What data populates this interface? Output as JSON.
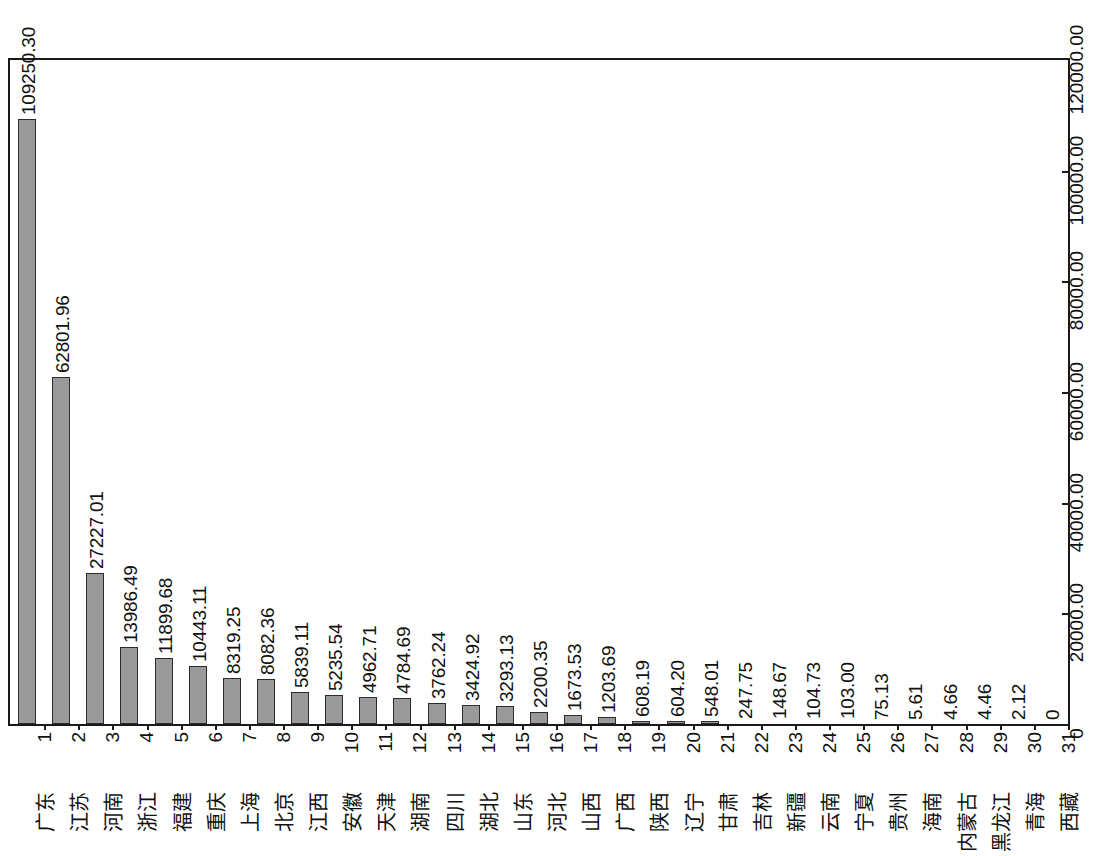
{
  "chart_data": {
    "type": "bar",
    "title": "",
    "subtitle": "",
    "xlabel": "",
    "ylabel": "",
    "orientation": "vertical-bars-rotated-page",
    "grid": false,
    "legend": null,
    "ylim": [
      0,
      120000
    ],
    "axis_ticks": [
      "0",
      "20000.00",
      "40000.00",
      "60000.00",
      "80000.00",
      "100000.00",
      "120000.00"
    ],
    "axis_tick_values": [
      0,
      20000,
      40000,
      60000,
      80000,
      100000,
      120000
    ],
    "indices": [
      "1",
      "2",
      "3",
      "4",
      "5",
      "6",
      "7",
      "8",
      "9",
      "10",
      "11",
      "12",
      "13",
      "14",
      "15",
      "16",
      "17",
      "18",
      "19",
      "20",
      "21",
      "22",
      "23",
      "24",
      "25",
      "26",
      "27",
      "28",
      "29",
      "30",
      "31"
    ],
    "categories": [
      "广东",
      "江苏",
      "河南",
      "浙江",
      "福建",
      "重庆",
      "上海",
      "北京",
      "江西",
      "安徽",
      "天津",
      "湖南",
      "四川",
      "湖北",
      "山东",
      "河北",
      "山西",
      "广西",
      "陕西",
      "辽宁",
      "甘肃",
      "吉林",
      "新疆",
      "云南",
      "宁夏",
      "贵州",
      "海南",
      "内蒙古",
      "黑龙江",
      "青海",
      "西藏"
    ],
    "values": [
      109250.3,
      62801.96,
      27227.01,
      13986.49,
      11899.68,
      10443.11,
      8319.25,
      8082.36,
      5839.11,
      5235.54,
      4962.71,
      4784.69,
      3762.24,
      3424.92,
      3293.13,
      2200.35,
      1673.53,
      1203.69,
      608.19,
      604.2,
      548.01,
      247.75,
      148.67,
      104.73,
      103.0,
      75.13,
      5.61,
      4.66,
      4.46,
      2.12,
      0
    ],
    "value_labels": [
      "109250.30",
      "62801.96",
      "27227.01",
      "13986.49",
      "11899.68",
      "10443.11",
      "8319.25",
      "8082.36",
      "5839.11",
      "5235.54",
      "4962.71",
      "4784.69",
      "3762.24",
      "3424.92",
      "3293.13",
      "2200.35",
      "1673.53",
      "1203.69",
      "608.19",
      "604.20",
      "548.01",
      "247.75",
      "148.67",
      "104.73",
      "103.00",
      "75.13",
      "5.61",
      "4.66",
      "4.46",
      "2.12",
      "0"
    ],
    "bar_fill_color": "#9a9a9a",
    "bar_border_color": "#2b2b2b",
    "axis_color": "#1a1a1a",
    "background_color": "#ffffff"
  }
}
